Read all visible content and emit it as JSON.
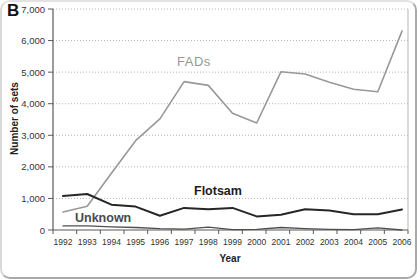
{
  "figure": {
    "panel_label": "B"
  },
  "colors": {
    "background": "#ffffff",
    "axis": "#595959",
    "grid": "#b5b5b5",
    "tick_text": "#333333",
    "frame_border": "#a9a9a9"
  },
  "chart_data": {
    "type": "line",
    "title": "",
    "xlabel": "Year",
    "ylabel": "Number of sets",
    "ylim": [
      0,
      7000
    ],
    "y_tick_step": 1000,
    "y_tick_labels": [
      "0",
      "1,000",
      "2,000",
      "3,000",
      "4,000",
      "5,000",
      "6,000",
      "7,000"
    ],
    "categories": [
      "1992",
      "1993",
      "1994",
      "1995",
      "1996",
      "1997",
      "1998",
      "1999",
      "2000",
      "2001",
      "2002",
      "2003",
      "2004",
      "2005",
      "2006"
    ],
    "grid": "horizontal-dotted",
    "legend_position": "inline-labels",
    "series": [
      {
        "name": "FADs",
        "color": "#989898",
        "stroke_width": 1.6,
        "values": [
          570,
          750,
          1800,
          2830,
          3520,
          4700,
          4580,
          3700,
          3390,
          5010,
          4940,
          4680,
          4460,
          4380,
          6300
        ]
      },
      {
        "name": "Flotsam",
        "color": "#262626",
        "stroke_width": 2,
        "values": [
          1080,
          1140,
          800,
          740,
          450,
          700,
          660,
          700,
          430,
          480,
          660,
          620,
          500,
          500,
          650
        ]
      },
      {
        "name": "Unknown",
        "color": "#4f4f4f",
        "stroke_width": 1.3,
        "values": [
          130,
          130,
          100,
          80,
          40,
          30,
          90,
          10,
          20,
          80,
          40,
          20,
          10,
          70,
          0
        ]
      }
    ]
  }
}
